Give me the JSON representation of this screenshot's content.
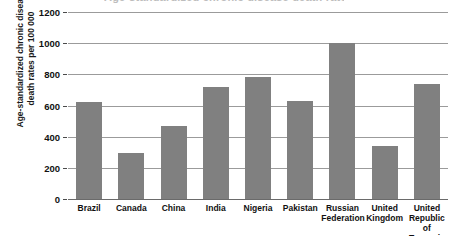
{
  "title_crop": {
    "text": "Age-standardized chronic disease death rates",
    "visible_note": "cropped title descenders at top edge"
  },
  "axis": {
    "y_title_lines": [
      "Age-standardized chronic disease",
      "death rates per 100 000"
    ],
    "y_ticks": [
      "0",
      "200",
      "400",
      "600",
      "800",
      "1000",
      "1200"
    ]
  },
  "colors": {
    "bar": "#808080",
    "gridline": "#9b9b9b",
    "axis_line": "#6a6a6a",
    "text": "#111111",
    "background": "#ffffff"
  },
  "chart_data": {
    "type": "bar",
    "title": "Age-standardized chronic disease death rates",
    "xlabel": "",
    "ylabel": "Age-standardized chronic disease death rates per 100 000",
    "ylim": [
      0,
      1200
    ],
    "ytick_interval": 200,
    "grid": true,
    "legend": "none",
    "categories": [
      "Brazil",
      "Canada",
      "China",
      "India",
      "Nigeria",
      "Pakistan",
      "Russian Federation",
      "United Kingdom",
      "United Republic of Tanzania"
    ],
    "category_label_lines": [
      [
        "Brazil"
      ],
      [
        "Canada"
      ],
      [
        "China"
      ],
      [
        "India"
      ],
      [
        "Nigeria"
      ],
      [
        "Pakistan"
      ],
      [
        "Russian",
        "Federation"
      ],
      [
        "United",
        "Kingdom"
      ],
      [
        "United",
        "Republic",
        "of Tanzania"
      ]
    ],
    "values": [
      620,
      295,
      470,
      720,
      780,
      628,
      1000,
      340,
      740
    ]
  }
}
